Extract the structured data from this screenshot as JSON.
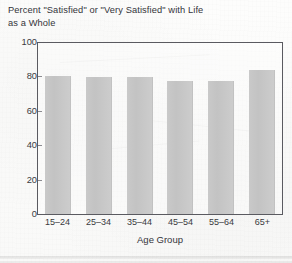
{
  "chart_data": {
    "type": "bar",
    "title": "Percent \"Satisfied\" or \"Very Satisfied\" with Life as a Whole",
    "title_line1": "Percent \"Satisfied\" or \"Very Satisfied\" with Life",
    "title_line2": "as a Whole",
    "categories": [
      "15–24",
      "25–34",
      "35–44",
      "45–54",
      "55–64",
      "65+"
    ],
    "values": [
      80,
      79,
      79,
      77,
      77,
      83
    ],
    "xlabel": "Age Group",
    "ylabel": "",
    "ylim": [
      0,
      100
    ],
    "yticks": [
      0,
      20,
      40,
      60,
      80,
      100
    ],
    "ytick_labels": [
      "0",
      "20",
      "40",
      "60",
      "80",
      "100"
    ],
    "grid": false,
    "legend": null,
    "bar_color": "#c7c7c7",
    "axis_color": "#5a5a60",
    "text_color": "#34343a",
    "background_color": "#fbfbfa"
  }
}
